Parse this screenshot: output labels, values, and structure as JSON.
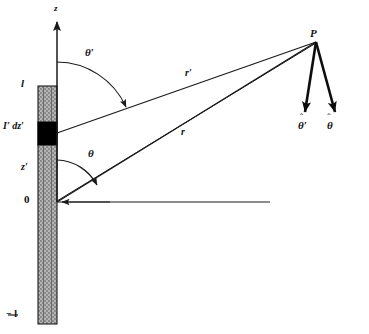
{
  "figure": {
    "labels": {
      "z_axis": "z",
      "rod_top": "l",
      "current_element": "I′ dz′",
      "source_coordinate": "z′",
      "origin": "0",
      "rod_bottom": "− l",
      "angle_source": "θ′",
      "angle_origin": "θ",
      "distance_source": "r′",
      "distance_origin": "r",
      "field_point": "P",
      "unit_vector_theta_prime": "θ′",
      "unit_vector_theta": "θ",
      "hat_mark": "ˆ"
    },
    "colors": {
      "stroke": "#1a1a1a",
      "rod_fill": "#a8a8a8",
      "rod_core": "#000000",
      "background": "#ffffff"
    },
    "geometry": {
      "origin": [
        57,
        202
      ],
      "field_point_P": [
        316,
        40
      ],
      "rod_top_y": 86,
      "rod_bottom_y": 324,
      "element_top_y": 122,
      "element_bottom_y": 145,
      "horizontal_axis_end_x": 270,
      "z_axis_top_y": 18
    }
  }
}
